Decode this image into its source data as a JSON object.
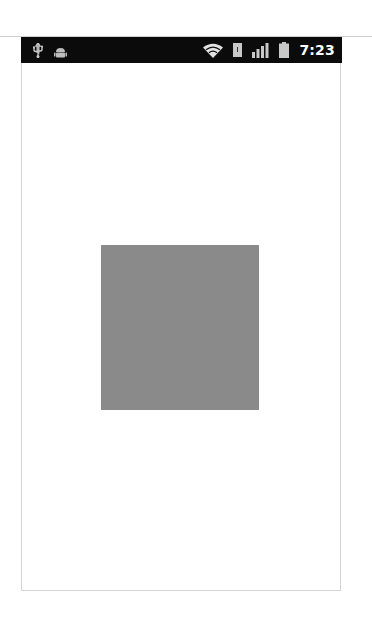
{
  "status_bar": {
    "left_icons": [
      "usb-icon",
      "android-debug-icon"
    ],
    "right_icons": [
      "wifi-icon",
      "sd-card-icon",
      "signal-icon",
      "battery-icon"
    ],
    "time": "7:23",
    "background": "#0b0b0b"
  },
  "content": {
    "square": {
      "color": "#8a8a8a"
    }
  }
}
